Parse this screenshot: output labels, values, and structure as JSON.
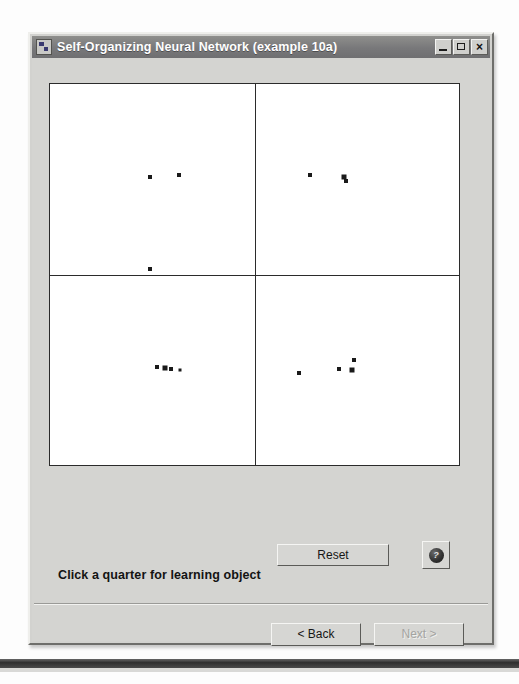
{
  "window": {
    "title": "Self-Organizing Neural Network (example 10a)",
    "app_icon": "application-window-icon",
    "controls": {
      "minimize": "–",
      "maximize": "□",
      "close": "×"
    }
  },
  "main": {
    "status_text": "Click a quarter for learning object",
    "reset_label": "Reset",
    "help_label": "?",
    "back_label": "< Back",
    "next_label": "Next >",
    "next_enabled": false
  },
  "chart_data": {
    "type": "scatter",
    "xlabel": "",
    "ylabel": "",
    "xlim": [
      0,
      100
    ],
    "ylim": [
      0,
      100
    ],
    "grid": false,
    "quadrants": [
      {
        "name": "top-left",
        "points": [
          {
            "x": 24.5,
            "y": 75.5,
            "size": 4
          },
          {
            "x": 31.5,
            "y": 76.0,
            "size": 4
          },
          {
            "x": 24.5,
            "y": 51.5,
            "size": 4
          }
        ]
      },
      {
        "name": "top-right",
        "points": [
          {
            "x": 63.5,
            "y": 76.0,
            "size": 4
          },
          {
            "x": 72.0,
            "y": 75.6,
            "size": 5
          },
          {
            "x": 72.4,
            "y": 74.6,
            "size": 4
          }
        ]
      },
      {
        "name": "bottom-left",
        "points": [
          {
            "x": 26.2,
            "y": 25.6,
            "size": 4
          },
          {
            "x": 28.0,
            "y": 25.4,
            "size": 5
          },
          {
            "x": 29.6,
            "y": 25.1,
            "size": 4
          },
          {
            "x": 31.8,
            "y": 25.0,
            "size": 3
          }
        ]
      },
      {
        "name": "bottom-right",
        "points": [
          {
            "x": 60.8,
            "y": 24.1,
            "size": 4
          },
          {
            "x": 70.6,
            "y": 25.1,
            "size": 4
          },
          {
            "x": 73.8,
            "y": 24.9,
            "size": 5
          },
          {
            "x": 74.4,
            "y": 27.5,
            "size": 4
          }
        ]
      }
    ]
  }
}
